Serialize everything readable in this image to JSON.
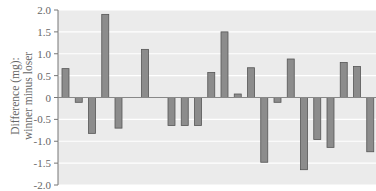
{
  "chart_data": {
    "type": "bar",
    "title": "",
    "xlabel": "",
    "ylabel": "Difference (mg): winner minus loser",
    "ylabel_lines": [
      "Difference (mg):",
      "winner minus loser"
    ],
    "ylim": [
      -2.0,
      2.0
    ],
    "yticks": [
      2.0,
      1.5,
      1.0,
      0.5,
      0,
      -0.5,
      -1.0,
      -1.5,
      -2.0
    ],
    "ytick_labels": [
      "2.0",
      "1.5",
      "1.0",
      "0.5",
      "0",
      "-0.5",
      "-1.0",
      "-1.5",
      "-2.0"
    ],
    "grid": true,
    "legend": null,
    "slots": 24,
    "categories": [
      1,
      2,
      3,
      4,
      5,
      7,
      9,
      10,
      11,
      12,
      13,
      14,
      15,
      16,
      17,
      18,
      19,
      20,
      21,
      22,
      23,
      24
    ],
    "values": [
      0.66,
      -0.11,
      -0.82,
      1.9,
      -0.7,
      1.1,
      -0.64,
      -0.64,
      -0.64,
      0.57,
      1.5,
      0.08,
      0.68,
      -1.48,
      -0.11,
      0.88,
      -1.65,
      -0.96,
      -1.14,
      0.8,
      0.71,
      -1.24
    ],
    "colors": {
      "plot_bg": "#ebebeb",
      "grid": "#ffffff",
      "bar_fill": "#8c8c8c",
      "bar_edge": "#555555",
      "axis": "#777777",
      "zero_line": "#888888"
    }
  }
}
